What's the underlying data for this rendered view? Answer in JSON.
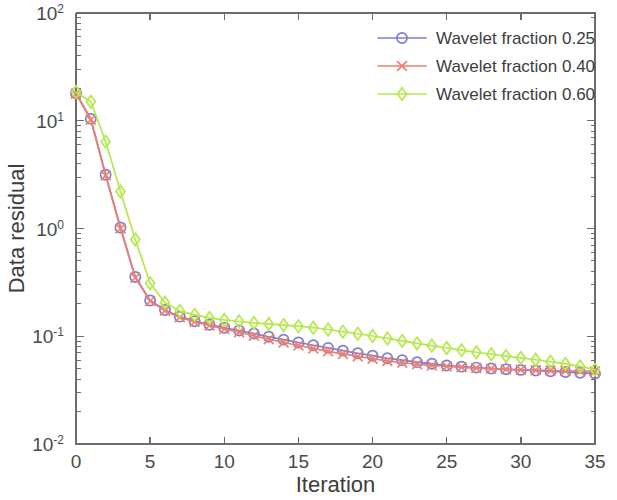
{
  "chart_data": {
    "type": "line",
    "title": "",
    "xlabel": "Iteration",
    "ylabel": "Data residual",
    "xlim": [
      0,
      35
    ],
    "ylim": [
      0.01,
      100
    ],
    "yscale": "log",
    "xscale": "linear",
    "grid": false,
    "legend_position": "top-right",
    "xticks": [
      0,
      5,
      10,
      15,
      20,
      25,
      30,
      35
    ],
    "xtick_labels": [
      "0",
      "5",
      "10",
      "15",
      "20",
      "25",
      "30",
      "35"
    ],
    "yticks": [
      0.01,
      0.1,
      1,
      10,
      100
    ],
    "ytick_labels": [
      "10-2",
      "10-1",
      "100",
      "101",
      "102"
    ],
    "ytick_mantissas": [
      "10",
      "10",
      "10",
      "10",
      "10"
    ],
    "ytick_exponents": [
      "-2",
      "-1",
      "0",
      "1",
      "2"
    ],
    "x": [
      0,
      1,
      2,
      3,
      4,
      5,
      6,
      7,
      8,
      9,
      10,
      11,
      12,
      13,
      14,
      15,
      16,
      17,
      18,
      19,
      20,
      21,
      22,
      23,
      24,
      25,
      26,
      27,
      28,
      29,
      30,
      31,
      32,
      33,
      34,
      35
    ],
    "series": [
      {
        "name": "Wavelet fraction 0.25",
        "color": "#7b7fd0",
        "marker": "circle",
        "values": [
          18.0,
          10.4,
          3.15,
          1.02,
          0.355,
          0.215,
          0.175,
          0.152,
          0.138,
          0.128,
          0.12,
          0.113,
          0.106,
          0.099,
          0.093,
          0.0875,
          0.0825,
          0.078,
          0.0735,
          0.0695,
          0.066,
          0.0625,
          0.06,
          0.0575,
          0.0555,
          0.0535,
          0.0522,
          0.0512,
          0.0502,
          0.0494,
          0.0487,
          0.048,
          0.0473,
          0.0466,
          0.0458,
          0.045
        ]
      },
      {
        "name": "Wavelet fraction 0.40",
        "color": "#ef7f6d",
        "marker": "x",
        "values": [
          17.8,
          10.2,
          3.1,
          1.0,
          0.35,
          0.212,
          0.172,
          0.15,
          0.136,
          0.126,
          0.117,
          0.109,
          0.101,
          0.094,
          0.0875,
          0.082,
          0.077,
          0.0725,
          0.0685,
          0.065,
          0.0618,
          0.059,
          0.0568,
          0.055,
          0.0536,
          0.0524,
          0.0515,
          0.0507,
          0.05,
          0.0494,
          0.0489,
          0.0484,
          0.048,
          0.0477,
          0.0474,
          0.0472
        ]
      },
      {
        "name": "Wavelet fraction 0.60",
        "color": "#b5e84a",
        "marker": "diamond",
        "values": [
          18.5,
          15.0,
          6.4,
          2.2,
          0.79,
          0.31,
          0.205,
          0.172,
          0.158,
          0.148,
          0.142,
          0.137,
          0.133,
          0.13,
          0.127,
          0.124,
          0.12,
          0.1155,
          0.1105,
          0.1055,
          0.1005,
          0.0955,
          0.0905,
          0.086,
          0.0818,
          0.0778,
          0.0742,
          0.071,
          0.0682,
          0.0655,
          0.063,
          0.0605,
          0.058,
          0.0555,
          0.0525,
          0.049
        ]
      }
    ]
  },
  "legend": {
    "entries": [
      {
        "label": "Wavelet fraction 0.25"
      },
      {
        "label": "Wavelet fraction 0.40"
      },
      {
        "label": "Wavelet fraction 0.60"
      }
    ]
  },
  "axes": {
    "x_title": "Iteration",
    "y_title": "Data residual"
  }
}
